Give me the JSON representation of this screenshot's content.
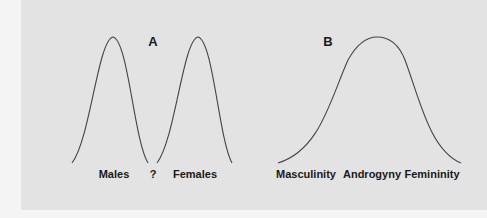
{
  "figure": {
    "panel_a": {
      "title": "A",
      "labels": [
        "Males",
        "?",
        "Females"
      ],
      "curves": [
        "Males distribution",
        "Females distribution"
      ]
    },
    "panel_b": {
      "title": "B",
      "labels": [
        "Masculinity",
        "Androgyny",
        "Femininity"
      ],
      "curves": [
        "Single continuum distribution"
      ]
    },
    "colors": {
      "background": "#e3e3e3",
      "curve": "#444444",
      "text": "#1a1a1a"
    }
  }
}
